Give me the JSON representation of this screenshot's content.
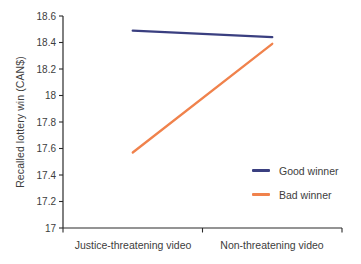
{
  "figure": {
    "background": "#ffffff",
    "text_color": "#3d3d3d",
    "axis_color": "#2a2a2a"
  },
  "chart_data": {
    "type": "line",
    "title": "",
    "xlabel": "",
    "ylabel": "Recalled lottery win (CAN$)",
    "categories": [
      "Justice-threatening video",
      "Non-threatening video"
    ],
    "series": [
      {
        "name": "Good winner",
        "color": "#3a3f80",
        "values": [
          18.49,
          18.44
        ]
      },
      {
        "name": "Bad winner",
        "color": "#f0824c",
        "values": [
          17.57,
          18.39
        ]
      }
    ],
    "ylim": [
      17,
      18.6
    ],
    "ytick_step": 0.2,
    "ytick_labels": [
      "17",
      "17.2",
      "17.4",
      "17.6",
      "17.8",
      "18",
      "18.2",
      "18.4",
      "18.6"
    ],
    "grid": false,
    "legend_position": "right-middle"
  }
}
